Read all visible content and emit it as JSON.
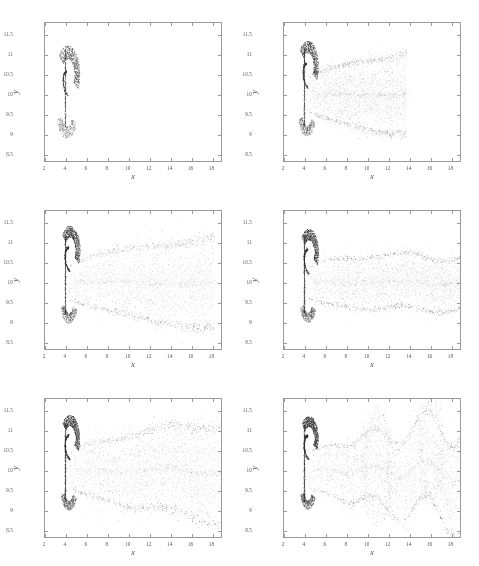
{
  "figure": {
    "background": "#ffffff",
    "point_color": "#2b2b2b",
    "frame_color": "#9a9a9a",
    "layout": "3 rows x 2 columns",
    "panel_count": 6
  },
  "axes": {
    "xlabel": "x",
    "ylabel": "y",
    "xlim": [
      2,
      19
    ],
    "ylim": [
      8.3,
      11.8
    ],
    "xticks": [
      2,
      4,
      6,
      8,
      10,
      12,
      14,
      16,
      18
    ],
    "xticklabels": [
      "2",
      "4",
      "6",
      "8",
      "10",
      "12",
      "14",
      "16",
      "18"
    ],
    "yticks": [
      8.5,
      9,
      9.5,
      10,
      10.5,
      11,
      11.5
    ],
    "yticklabels": [
      "8.5",
      "9",
      "9.5",
      "10",
      "10.5",
      "11",
      "11.5"
    ],
    "grid": false,
    "tick_direction": "in",
    "mirror_ticks": true
  },
  "chart_data": {
    "type": "scatter",
    "title": "",
    "subtitle": "",
    "xlabel": "x",
    "ylabel": "y",
    "xlim": [
      2,
      19
    ],
    "ylim": [
      8.3,
      11.8
    ],
    "grid": false,
    "legend": null,
    "marker": {
      "shape": "dot",
      "size_px": 0.6,
      "color": "#2b2b2b",
      "alpha": 0.3
    },
    "panels": [
      {
        "index": 1,
        "position": "top-left",
        "description": "Compact vortex pair near injection point; roll-up just beginning, plume confined to x < 8",
        "n_points": 5200,
        "plume_extent_x": [
          3.4,
          7.8
        ],
        "plume_extent_y": [
          8.6,
          11.3
        ],
        "core_x": 4.2,
        "core_y": 10.5,
        "stem_x": 3.95,
        "arc_radius": 1.35,
        "tail_length": 0.4,
        "wave_amplitude": 0.0,
        "wave_count": 0,
        "spread": 0.3
      },
      {
        "index": 2,
        "position": "top-right",
        "description": "Plume elongates downstream; thin axial filament along y = 10 reaching x ~ 14",
        "n_points": 6400,
        "plume_extent_x": [
          3.4,
          14.5
        ],
        "plume_extent_y": [
          8.7,
          11.35
        ],
        "core_x": 4.3,
        "core_y": 10.7,
        "stem_x": 3.95,
        "arc_radius": 1.2,
        "tail_length": 9.5,
        "wave_amplitude": 0.06,
        "wave_count": 1,
        "spread": 0.34
      },
      {
        "index": 3,
        "position": "middle-left",
        "description": "Wide lobed wake filling most of the domain; upper and lower shear layers clearly separated",
        "n_points": 7200,
        "plume_extent_x": [
          3.4,
          18.6
        ],
        "plume_extent_y": [
          8.45,
          11.55
        ],
        "core_x": 4.4,
        "core_y": 10.8,
        "stem_x": 3.95,
        "arc_radius": 1.15,
        "tail_length": 14.0,
        "wave_amplitude": 0.1,
        "wave_count": 1,
        "spread": 0.4
      },
      {
        "index": 4,
        "position": "middle-right",
        "description": "Wake narrows into a cone with fine striations converging near x ~ 16",
        "n_points": 7400,
        "plume_extent_x": [
          3.4,
          18.9
        ],
        "plume_extent_y": [
          8.5,
          11.5
        ],
        "core_x": 4.4,
        "core_y": 10.75,
        "stem_x": 3.95,
        "arc_radius": 1.1,
        "tail_length": 15.0,
        "wave_amplitude": 0.14,
        "wave_count": 2,
        "spread": 0.38
      },
      {
        "index": 5,
        "position": "bottom-left",
        "description": "Broad turbulent plume spanning the full panel width with diffuse layered banding",
        "n_points": 7800,
        "plume_extent_x": [
          3.4,
          19.0
        ],
        "plume_extent_y": [
          8.35,
          11.7
        ],
        "core_x": 4.4,
        "core_y": 10.8,
        "stem_x": 3.95,
        "arc_radius": 1.1,
        "tail_length": 15.6,
        "wave_amplitude": 0.18,
        "wave_count": 2,
        "spread": 0.46
      },
      {
        "index": 6,
        "position": "bottom-right",
        "description": "Fully developed instability: large-amplitude meandering waves with detached vortex lobes near x ~ 11 and x ~ 16",
        "n_points": 8200,
        "plume_extent_x": [
          3.4,
          19.0
        ],
        "plume_extent_y": [
          8.3,
          11.75
        ],
        "core_x": 4.4,
        "core_y": 10.8,
        "stem_x": 3.95,
        "arc_radius": 1.05,
        "tail_length": 15.6,
        "wave_amplitude": 0.62,
        "wave_count": 3,
        "spread": 0.42
      }
    ]
  }
}
